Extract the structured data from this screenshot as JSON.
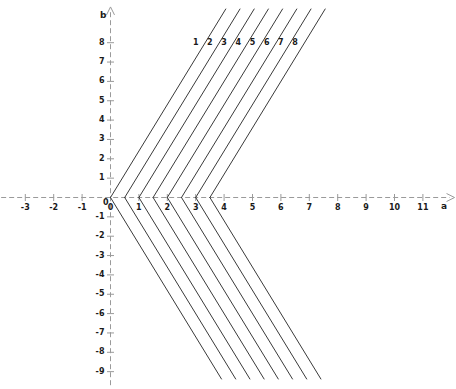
{
  "figure": {
    "background_color": "#ffffff",
    "axis_color": "#9a9a9a",
    "curve_color": "#3a3a3a",
    "text_color": "#1a1a1a"
  },
  "chart_data": {
    "type": "line",
    "title": "",
    "xlabel": "a",
    "ylabel": "b",
    "xlim": [
      -3.85,
      12.15
    ],
    "ylim": [
      -9.7,
      9.9
    ],
    "grid": false,
    "axis_style": "dashed-arrow",
    "xticks": [
      -3,
      -2,
      -1,
      0,
      1,
      2,
      3,
      4,
      5,
      6,
      7,
      8,
      9,
      10,
      11
    ],
    "xtick_labels": [
      "-3",
      "-2",
      "-1",
      "0",
      "1",
      "2",
      "3",
      "4",
      "5",
      "6",
      "7",
      "8",
      "9",
      "10",
      "11"
    ],
    "yticks": [
      -9,
      -8,
      -7,
      -6,
      -5,
      -4,
      -3,
      -2,
      -1,
      0,
      1,
      2,
      3,
      4,
      5,
      6,
      7,
      8
    ],
    "ytick_labels": [
      "-9",
      "-8",
      "-7",
      "-6",
      "-5",
      "-4",
      "-3",
      "-2",
      "-1",
      "0",
      "1",
      "2",
      "3",
      "4",
      "5",
      "6",
      "7",
      "8"
    ],
    "series": [
      {
        "name": "1",
        "vertex": [
          0.0,
          0
        ],
        "slope": 2.4,
        "label": "1"
      },
      {
        "name": "2",
        "vertex": [
          0.5,
          0
        ],
        "slope": 2.4,
        "label": "2"
      },
      {
        "name": "3",
        "vertex": [
          1.0,
          0
        ],
        "slope": 2.4,
        "label": "3"
      },
      {
        "name": "4",
        "vertex": [
          1.5,
          0
        ],
        "slope": 2.4,
        "label": "4"
      },
      {
        "name": "5",
        "vertex": [
          2.0,
          0
        ],
        "slope": 2.4,
        "label": "5"
      },
      {
        "name": "6",
        "vertex": [
          2.5,
          0
        ],
        "slope": 2.4,
        "label": "6"
      },
      {
        "name": "7",
        "vertex": [
          3.0,
          0
        ],
        "slope": 2.4,
        "label": "7"
      },
      {
        "name": "8",
        "vertex": [
          3.5,
          0
        ],
        "slope": 2.4,
        "label": "8"
      }
    ],
    "curve_labels": [
      {
        "text": "1",
        "x": 3.0,
        "y": 8.0
      },
      {
        "text": "2",
        "x": 3.5,
        "y": 8.0
      },
      {
        "text": "3",
        "x": 4.0,
        "y": 8.0
      },
      {
        "text": "4",
        "x": 4.5,
        "y": 8.0
      },
      {
        "text": "5",
        "x": 5.0,
        "y": 8.0
      },
      {
        "text": "6",
        "x": 5.5,
        "y": 8.0
      },
      {
        "text": "7",
        "x": 6.0,
        "y": 8.0
      },
      {
        "text": "8",
        "x": 6.5,
        "y": 8.0
      }
    ]
  }
}
